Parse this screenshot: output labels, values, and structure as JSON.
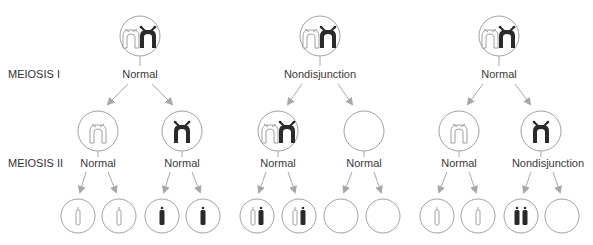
{
  "stages": {
    "meiosis1": "MEIOSIS I",
    "meiosis2": "MEIOSIS II"
  },
  "columns": [
    {
      "meiosis1_event": "Normal",
      "meiosis2_events": [
        "Normal",
        "Normal"
      ],
      "daughter_cells": [
        "white-pair",
        "black-pair"
      ],
      "gametes": [
        "white",
        "white",
        "black",
        "black"
      ]
    },
    {
      "meiosis1_event": "Nondisjunction",
      "meiosis2_events": [
        "Normal",
        "Normal"
      ],
      "daughter_cells": [
        "both-pairs",
        "empty"
      ],
      "gametes": [
        "white+black",
        "white+black",
        "empty",
        "empty"
      ]
    },
    {
      "meiosis1_event": "Normal",
      "meiosis2_events": [
        "Normal",
        "Nondisjunction"
      ],
      "daughter_cells": [
        "white-pair",
        "black-pair"
      ],
      "gametes": [
        "white",
        "white",
        "black+black",
        "empty"
      ]
    }
  ],
  "colors": {
    "stroke": "#a0a0a0",
    "chromosome_dark": "#2a2a2a",
    "chromosome_light": "#ffffff",
    "arrow": "#a8a8a8"
  }
}
